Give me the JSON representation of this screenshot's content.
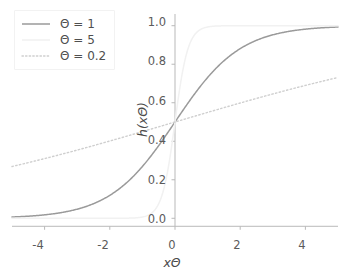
{
  "chart_data": {
    "type": "line",
    "title": "",
    "xlabel": "xΘ",
    "ylabel": "h(xΘ)",
    "xlim": [
      -5,
      5
    ],
    "ylim": [
      -0.04,
      1.04
    ],
    "xticks": [
      "-4",
      "-2",
      "0",
      "2",
      "4"
    ],
    "xtick_values": [
      -4,
      -2,
      0,
      2,
      4
    ],
    "yticks": [
      "0.0",
      "0.2",
      "0.4",
      "0.6",
      "0.8",
      "1.0"
    ],
    "ytick_values": [
      0.0,
      0.2,
      0.4,
      0.6,
      0.8,
      1.0
    ],
    "grid": false,
    "legend_position": "upper left",
    "function": "logistic sigmoid h(xΘ) = 1 / (1 + exp(-xΘ))",
    "series": [
      {
        "name": "Θ = 1",
        "theta": 1,
        "color": "#9a9a9a",
        "linestyle": "solid",
        "linewidth": 1.5,
        "x": [
          -5,
          -4.5,
          -4,
          -3.5,
          -3,
          -2.5,
          -2,
          -1.5,
          -1,
          -0.5,
          0,
          0.5,
          1,
          1.5,
          2,
          2.5,
          3,
          3.5,
          4,
          4.5,
          5
        ],
        "values": [
          0.007,
          0.011,
          0.018,
          0.029,
          0.047,
          0.076,
          0.119,
          0.182,
          0.269,
          0.378,
          0.5,
          0.622,
          0.731,
          0.818,
          0.881,
          0.924,
          0.953,
          0.971,
          0.982,
          0.989,
          0.993
        ]
      },
      {
        "name": "Θ = 5",
        "theta": 5,
        "color": "#f1f1f1",
        "linestyle": "solid",
        "linewidth": 1.5,
        "x": [
          -5,
          -4,
          -3,
          -2,
          -1.5,
          -1,
          -0.8,
          -0.6,
          -0.4,
          -0.2,
          0,
          0.2,
          0.4,
          0.6,
          0.8,
          1,
          1.5,
          2,
          3,
          4,
          5
        ],
        "values": [
          0.0,
          0.0,
          0.0,
          5e-05,
          0.0006,
          0.0067,
          0.018,
          0.047,
          0.119,
          0.269,
          0.5,
          0.731,
          0.881,
          0.953,
          0.982,
          0.993,
          0.9994,
          0.99995,
          1.0,
          1.0,
          1.0
        ]
      },
      {
        "name": "Θ = 0.2",
        "theta": 0.2,
        "color": "#cfcfcf",
        "linestyle": "dotted",
        "linewidth": 1.4,
        "x": [
          -5,
          -4,
          -3,
          -2,
          -1,
          0,
          1,
          2,
          3,
          4,
          5
        ],
        "values": [
          0.269,
          0.31,
          0.354,
          0.401,
          0.45,
          0.5,
          0.55,
          0.599,
          0.646,
          0.69,
          0.731
        ]
      }
    ]
  },
  "legend": {
    "entries": [
      {
        "label": "Θ = 1"
      },
      {
        "label": "Θ = 5"
      },
      {
        "label": "Θ = 0.2"
      }
    ]
  },
  "axes": {
    "x_axis_label": "xΘ",
    "y_axis_label": "h(xΘ)",
    "spine_color": "#b9b9b9",
    "tick_color": "#5b5b5b"
  }
}
